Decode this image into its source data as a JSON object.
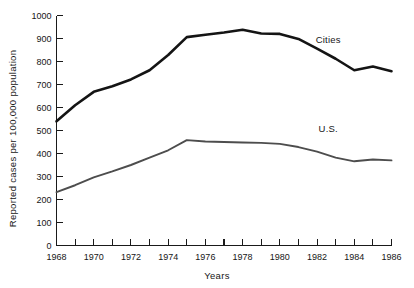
{
  "chart_data": {
    "type": "line",
    "title": "",
    "xlabel": "Years",
    "ylabel": "Reported cases per 100,000 population",
    "xlim": [
      1968,
      1986
    ],
    "ylim": [
      0,
      1000
    ],
    "grid": false,
    "legend_position": "inline-right",
    "x": [
      1968,
      1969,
      1970,
      1971,
      1972,
      1973,
      1974,
      1975,
      1976,
      1977,
      1978,
      1979,
      1980,
      1981,
      1982,
      1983,
      1984,
      1985,
      1986
    ],
    "x_tick_labels": [
      "1968",
      "1970",
      "1972",
      "1974",
      "1976",
      "1978",
      "1980",
      "1982",
      "1984",
      "1986"
    ],
    "x_tick_values": [
      1968,
      1970,
      1972,
      1974,
      1976,
      1978,
      1980,
      1982,
      1984,
      1986
    ],
    "x_minor_tick_values": [
      1969,
      1971,
      1973,
      1975,
      1977,
      1979,
      1981,
      1983,
      1985
    ],
    "y_tick_labels": [
      "0",
      "100",
      "200",
      "300",
      "400",
      "500",
      "600",
      "700",
      "800",
      "900",
      "1000"
    ],
    "y_tick_values": [
      0,
      100,
      200,
      300,
      400,
      500,
      600,
      700,
      800,
      900,
      1000
    ],
    "series": [
      {
        "name": "Cities",
        "color": "#141414",
        "width": 2.6,
        "label_x": 1982.6,
        "label_y": 880,
        "values": [
          540,
          610,
          668,
          692,
          722,
          762,
          828,
          906,
          916,
          926,
          938,
          922,
          920,
          898,
          856,
          812,
          762,
          778,
          758
        ]
      },
      {
        "name": "U.S.",
        "color": "#4d4d4d",
        "width": 1.9,
        "label_x": 1982.6,
        "label_y": 492,
        "values": [
          232,
          262,
          296,
          322,
          350,
          382,
          414,
          458,
          452,
          450,
          448,
          446,
          442,
          428,
          408,
          382,
          366,
          374,
          370
        ]
      }
    ]
  },
  "axes": {
    "ylabel": "Reported cases per 100,000 population",
    "xlabel": "Years"
  }
}
